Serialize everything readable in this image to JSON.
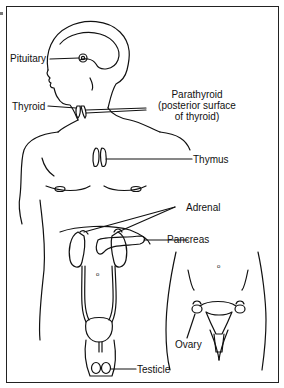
{
  "figure": {
    "labels": {
      "pituitary": "Pituitary",
      "thyroid": "Thyroid",
      "parathyroid_line1": "Parathyroid",
      "parathyroid_line2": "(posterior surface",
      "parathyroid_line3": "of thyroid)",
      "thymus": "Thymus",
      "adrenal": "Adrenal",
      "pancreas": "Pancreas",
      "ovary": "Ovary",
      "testicle": "Testicle"
    },
    "colors": {
      "line": "#111111",
      "background": "#ffffff",
      "frame": "#222222"
    }
  }
}
